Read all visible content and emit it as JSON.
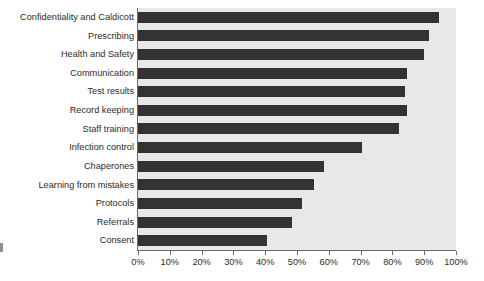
{
  "chart_data": {
    "type": "bar",
    "orientation": "horizontal",
    "title": "",
    "subtitle": "",
    "xlabel": "",
    "ylabel": "",
    "xlim": [
      0,
      100
    ],
    "grid": false,
    "legend": null,
    "bar_color": "#333333",
    "plot_background_color": "#e8e8e8",
    "axis_color": "#6b6b6b",
    "tick_labels": [
      "0%",
      "10%",
      "20%",
      "30%",
      "40%",
      "50%",
      "60%",
      "70%",
      "80%",
      "90%",
      "100%"
    ],
    "tick_values": [
      0,
      10,
      20,
      30,
      40,
      50,
      60,
      70,
      80,
      90,
      100
    ],
    "categories": [
      "Confidentiality and Caldicott",
      "Prescribing",
      "Health and Safety",
      "Communication",
      "Test results",
      "Record keeping",
      "Staff training",
      "Infection control",
      "Chaperones",
      "Learning from mistakes",
      "Protocols",
      "Referrals",
      "Consent"
    ],
    "values": [
      94.5,
      91.5,
      90,
      84.5,
      84,
      84.5,
      82,
      70.5,
      58.5,
      55.5,
      51.5,
      48.5,
      40.5
    ]
  }
}
